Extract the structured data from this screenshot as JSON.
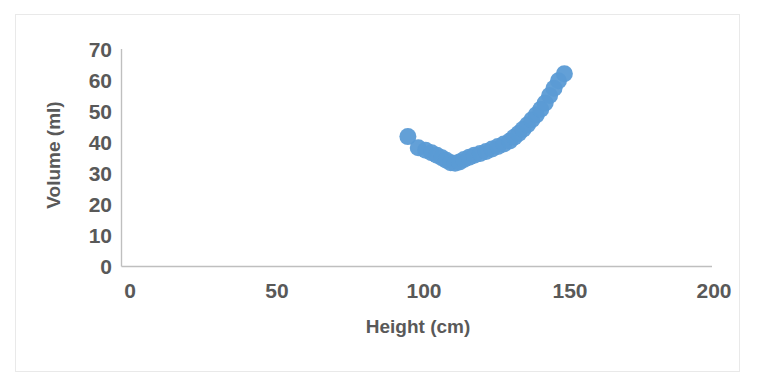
{
  "chart_data": {
    "type": "scatter",
    "title": "",
    "xlabel": "Height (cm)",
    "ylabel": "Volume (ml)",
    "xlim": [
      0,
      200
    ],
    "ylim": [
      0,
      70
    ],
    "xticks": [
      "0",
      "50",
      "100",
      "150",
      "200"
    ],
    "yticks": [
      "0",
      "10",
      "20",
      "30",
      "40",
      "50",
      "60",
      "70"
    ],
    "grid": false,
    "legend": "none",
    "marker_color": "#5b9bd5",
    "marker_size": 17,
    "axis_color": "#bfbfbf",
    "text_color": "#595959",
    "series": [
      {
        "name": "Volume vs Height",
        "x": [
          97.0,
          100.5,
          103.0,
          105.0,
          106.8,
          108.5,
          110.0,
          111.5,
          113.0,
          114.5,
          116.0,
          117.8,
          119.5,
          121.5,
          123.5,
          125.5,
          127.5,
          129.5,
          131.5,
          133.0,
          134.5,
          136.0,
          137.5,
          139.0,
          140.5,
          142.0,
          143.5,
          145.0,
          146.5,
          148.0,
          150.0
        ],
        "y": [
          41.8,
          38.2,
          37.4,
          36.6,
          35.8,
          35.0,
          34.2,
          33.4,
          33.2,
          33.6,
          34.4,
          35.2,
          35.8,
          36.4,
          37.0,
          37.8,
          38.6,
          39.4,
          40.4,
          41.6,
          42.8,
          44.2,
          45.6,
          47.2,
          48.8,
          50.6,
          52.6,
          55.0,
          57.4,
          59.8,
          62.0
        ]
      }
    ]
  },
  "axis": {
    "y_ticks": [
      {
        "label": "70",
        "value": 70
      },
      {
        "label": "60",
        "value": 60
      },
      {
        "label": "50",
        "value": 50
      },
      {
        "label": "40",
        "value": 40
      },
      {
        "label": "30",
        "value": 30
      },
      {
        "label": "20",
        "value": 20
      },
      {
        "label": "10",
        "value": 10
      },
      {
        "label": "0",
        "value": 0
      }
    ],
    "x_ticks": [
      {
        "label": "0",
        "value": 0
      },
      {
        "label": "50",
        "value": 50
      },
      {
        "label": "100",
        "value": 100
      },
      {
        "label": "150",
        "value": 150
      },
      {
        "label": "200",
        "value": 200
      }
    ],
    "x_title": "Height (cm)",
    "y_title": "Volume (ml)"
  }
}
